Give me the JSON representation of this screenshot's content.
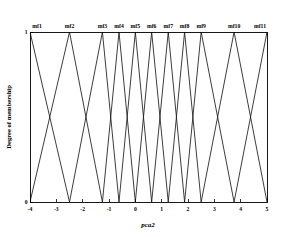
{
  "chart_data": {
    "type": "line",
    "title": "",
    "xlabel": "pca2",
    "ylabel": "Degree of membership",
    "xlim": [
      -4,
      5
    ],
    "ylim": [
      0,
      1
    ],
    "xticks": [
      -4,
      -3,
      -2,
      -1,
      0,
      1,
      2,
      3,
      4,
      5
    ],
    "xtick_labels": [
      "-4",
      "-3",
      "-2",
      "-1",
      "0",
      "1",
      "2",
      "3",
      "4",
      "5"
    ],
    "yticks": [
      0,
      1
    ],
    "ytick_labels": [
      "0",
      "1"
    ],
    "grid": false,
    "legend": "none",
    "annotations": [
      "mf1",
      "mf2",
      "mf3",
      "mf4",
      "mf5",
      "mf6",
      "mf7",
      "mf8",
      "mf9",
      "mf10",
      "mf11"
    ],
    "series": [
      {
        "name": "mf1",
        "label": "mf1",
        "peak": -4.0,
        "left": -5.25,
        "right": -2.5,
        "x": [
          -5.25,
          -4.0,
          -2.5
        ],
        "values": [
          0,
          1,
          0
        ]
      },
      {
        "name": "mf2",
        "label": "mf2",
        "peak": -2.5,
        "left": -4.0,
        "right": -1.25,
        "x": [
          -4.0,
          -2.5,
          -1.25
        ],
        "values": [
          0,
          1,
          0
        ]
      },
      {
        "name": "mf3",
        "label": "mf3",
        "peak": -1.25,
        "left": -2.5,
        "right": -0.62,
        "x": [
          -2.5,
          -1.25,
          -0.62
        ],
        "values": [
          0,
          1,
          0
        ]
      },
      {
        "name": "mf4",
        "label": "mf4",
        "peak": -0.62,
        "left": -1.25,
        "right": 0.0,
        "x": [
          -1.25,
          -0.62,
          0.0
        ],
        "values": [
          0,
          1,
          0
        ]
      },
      {
        "name": "mf5",
        "label": "mf5",
        "peak": 0.0,
        "left": -0.62,
        "right": 0.62,
        "x": [
          -0.62,
          0.0,
          0.62
        ],
        "values": [
          0,
          1,
          0
        ]
      },
      {
        "name": "mf6",
        "label": "mf6",
        "peak": 0.62,
        "left": 0.0,
        "right": 1.25,
        "x": [
          0.0,
          0.62,
          1.25
        ],
        "values": [
          0,
          1,
          0
        ]
      },
      {
        "name": "mf7",
        "label": "mf7",
        "peak": 1.25,
        "left": 0.62,
        "right": 1.87,
        "x": [
          0.62,
          1.25,
          1.87
        ],
        "values": [
          0,
          1,
          0
        ]
      },
      {
        "name": "mf8",
        "label": "mf8",
        "peak": 1.87,
        "left": 1.25,
        "right": 2.5,
        "x": [
          1.25,
          1.87,
          2.5
        ],
        "values": [
          0,
          1,
          0
        ]
      },
      {
        "name": "mf9",
        "label": "mf9",
        "peak": 2.5,
        "left": 1.87,
        "right": 3.75,
        "x": [
          1.87,
          2.5,
          3.75
        ],
        "values": [
          0,
          1,
          0
        ]
      },
      {
        "name": "mf10",
        "label": "mf10",
        "peak": 3.75,
        "left": 2.5,
        "right": 5.0,
        "x": [
          2.5,
          3.75,
          5.0
        ],
        "values": [
          0,
          1,
          0
        ]
      },
      {
        "name": "mf11",
        "label": "mf11",
        "peak": 5.0,
        "left": 3.75,
        "right": 6.25,
        "x": [
          3.75,
          5.0,
          6.25
        ],
        "values": [
          0,
          1,
          0
        ]
      }
    ]
  },
  "figure": {
    "x_axis_title": "pca2",
    "y_axis_title": "Degree of membership",
    "background_color": "#ffffff",
    "line_color": "#1a1a1a",
    "axis_color": "#000000"
  }
}
